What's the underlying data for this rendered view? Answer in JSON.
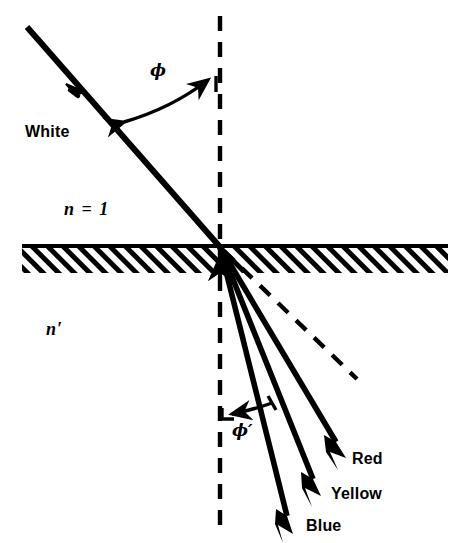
{
  "figure": {
    "kind": "refraction-dispersion-diagram",
    "colors": {
      "ink": "#000000",
      "background": "#ffffff"
    },
    "labels": {
      "incident_beam": "White",
      "medium_upper": "n = 1",
      "medium_lower": "n′",
      "angle_incidence": "ϕ",
      "angle_refraction": "ϕ′",
      "ray_red": "Red",
      "ray_yellow": "Yellow",
      "ray_blue": "Blue"
    },
    "geometry": {
      "interface_y": 246,
      "interface_x_start": 22,
      "interface_x_end": 448,
      "hatch_band_height": 26,
      "normal_x": 220,
      "normal_y_top": 16,
      "normal_y_bottom": 527,
      "incidence_point": {
        "x": 220,
        "y": 247
      },
      "incident_ray": {
        "x1": 27,
        "y1": 27,
        "x2": 220,
        "y2": 247
      },
      "incident_arrow_at": {
        "x": 79,
        "y": 86
      },
      "undeviated_dashed_ray": {
        "x1": 220,
        "y1": 247,
        "x2": 357,
        "y2": 379
      },
      "refracted_rays": [
        {
          "name": "Red",
          "x1": 220,
          "y1": 247,
          "x2": 344,
          "y2": 455
        },
        {
          "name": "Yellow",
          "x1": 220,
          "y1": 247,
          "x2": 320,
          "y2": 492
        },
        {
          "name": "Blue",
          "x1": 220,
          "y1": 247,
          "x2": 293,
          "y2": 531
        }
      ],
      "angle_arc_incidence": {
        "from_ray": true,
        "double_headed": true
      },
      "angle_arc_refraction": {
        "to_normal": true,
        "double_headed": false
      }
    }
  }
}
